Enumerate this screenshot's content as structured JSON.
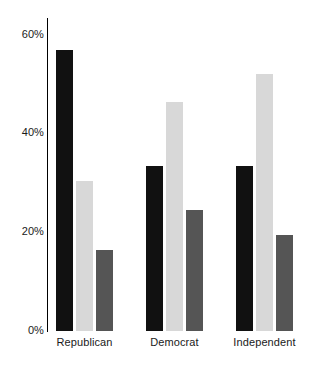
{
  "chart_data": {
    "type": "bar",
    "title": "",
    "subtitle": "",
    "xlabel": "",
    "ylabel": "",
    "categories": [
      "Republican",
      "Democrat",
      "Independent"
    ],
    "series": [
      {
        "name": "series-1",
        "color": "#111111",
        "values": [
          57,
          33.5,
          33.5
        ]
      },
      {
        "name": "series-2",
        "color": "#d8d8d8",
        "values": [
          30.5,
          46.5,
          52
        ]
      },
      {
        "name": "series-3",
        "color": "#555555",
        "values": [
          16.5,
          24.5,
          19.5
        ]
      }
    ],
    "ylim": [
      0,
      60
    ],
    "yticks": [
      0,
      20,
      40,
      60
    ],
    "ytick_labels": [
      "0%",
      "20%",
      "40%",
      "60%"
    ],
    "grid": false,
    "legend": "none",
    "value_suffix": "%"
  },
  "axis": {
    "tick_0": "0%",
    "tick_20": "20%",
    "tick_40": "40%",
    "tick_60": "60%"
  },
  "groups": {
    "g0_label": "Republican",
    "g1_label": "Democrat",
    "g2_label": "Independent"
  },
  "colors": {
    "bar_dark": "#111111",
    "bar_light": "#d8d8d8",
    "bar_mid": "#555555",
    "axis": "#000000",
    "text": "#1a1a1a",
    "background": "#ffffff"
  }
}
